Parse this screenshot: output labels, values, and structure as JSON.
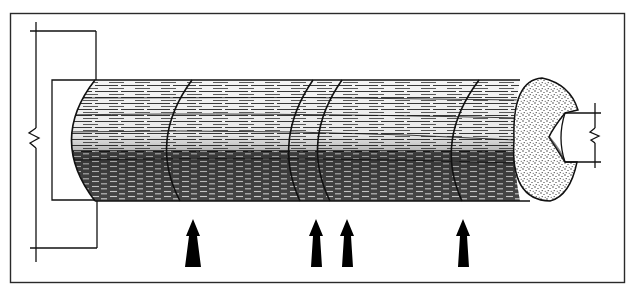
{
  "diagram": {
    "type": "technical-line-drawing",
    "colors": {
      "background": "#ffffff",
      "ink": "#111111",
      "frame": "#2a2a2a"
    },
    "frame": {
      "x": 10,
      "y": 13,
      "width": 615,
      "height": 270
    },
    "cylinder": {
      "top_y": 80,
      "bottom_y": 201,
      "left_cap_x": 62,
      "right_end_cx": 547,
      "bands_x": [
        165,
        287,
        315,
        452
      ]
    },
    "arrows": {
      "direction": "up",
      "positions_x": [
        193,
        316,
        347,
        463
      ],
      "tip_y": 219,
      "base_y": 267
    },
    "left_bracket": {
      "break_symbol": "zigzag",
      "break_y": 138
    },
    "right_bracket": {
      "break_symbol": "zigzag",
      "break_y": 135
    }
  }
}
